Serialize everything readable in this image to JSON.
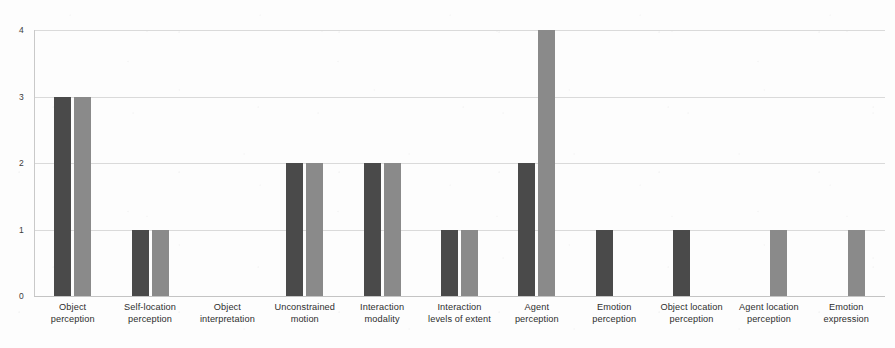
{
  "chart_data": {
    "type": "bar",
    "title": "",
    "subtitle": "",
    "xlabel": "",
    "ylabel": "",
    "ylim": [
      0,
      4
    ],
    "y_ticks": [
      "0",
      "1",
      "2",
      "3",
      "4"
    ],
    "grid": true,
    "legend": "none",
    "orientation": "vertical",
    "grouping": "grouped",
    "categories": [
      "Object perception",
      "Self-location perception",
      "Object interpretation",
      "Unconstrained motion",
      "Interaction modality",
      "Interaction levels of extent",
      "Agent perception",
      "Emotion perception",
      "Object location perception",
      "Agent location perception",
      "Emotion expression"
    ],
    "category_lines": [
      [
        "Object",
        "perception"
      ],
      [
        "Self-location",
        "perception"
      ],
      [
        "Object",
        "interpretation"
      ],
      [
        "Unconstrained",
        "motion"
      ],
      [
        "Interaction",
        "modality"
      ],
      [
        "Interaction",
        "levels of extent"
      ],
      [
        "Agent",
        "perception"
      ],
      [
        "Emotion",
        "perception"
      ],
      [
        "Object location",
        "perception"
      ],
      [
        "Agent location",
        "perception"
      ],
      [
        "Emotion",
        "expression"
      ]
    ],
    "series": [
      {
        "name": "Series 1",
        "color": "#4a4a4a",
        "values": [
          3,
          1,
          0,
          2,
          2,
          1,
          2,
          1,
          1,
          0,
          0
        ]
      },
      {
        "name": "Series 2",
        "color": "#8a8a8a",
        "values": [
          3,
          1,
          0,
          2,
          2,
          1,
          4,
          0,
          0,
          1,
          1
        ]
      }
    ],
    "colors": {
      "series_a": "#4a4a4a",
      "series_b": "#8a8a8a",
      "gridline": "#dadada",
      "axis": "#c4c4c4",
      "background": "#fdfdfd",
      "tick_text": "#3c3c3c",
      "label_text": "#2e2e2e"
    },
    "geometry": {
      "plot_left": 34,
      "plot_right": 885,
      "plot_top": 30,
      "baseline_y": 296,
      "label_top": 302,
      "bar_width": 17,
      "bar_gap": 3
    }
  }
}
